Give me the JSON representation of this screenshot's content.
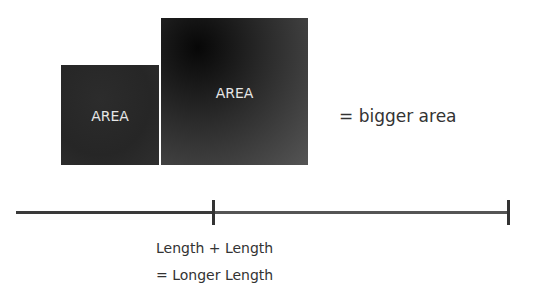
{
  "diagram": {
    "squares": [
      {
        "label": "AREA",
        "size": "small"
      },
      {
        "label": "AREA",
        "size": "large"
      }
    ],
    "area_result": "= bigger area",
    "length_line": {
      "segments": 2,
      "caption_line1": "Length + Length",
      "caption_line2": "= Longer Length"
    },
    "colors": {
      "square": "#2a2a2a",
      "line": "#3a3a3a",
      "text": "#333333"
    }
  }
}
